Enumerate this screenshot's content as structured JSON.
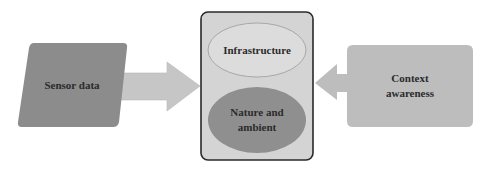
{
  "diagram": {
    "nodes": [
      {
        "id": "sensor",
        "label": "Sensor data",
        "shape": "parallelogram",
        "fill": "#8c8c8c"
      },
      {
        "id": "center",
        "label": "",
        "shape": "rounded-rect",
        "fill": "#d4d4d4",
        "stroke": "#2a2a2a"
      },
      {
        "id": "infra",
        "label": "Infrastructure",
        "shape": "ellipse",
        "fill": "#dcdcdc",
        "stroke": "#9a9a9a"
      },
      {
        "id": "nature",
        "label_line1": "Nature and",
        "label_line2": "ambient",
        "shape": "ellipse",
        "fill": "#8f8f8f"
      },
      {
        "id": "context",
        "label_line1": "Context",
        "label_line2": "awareness",
        "shape": "left-arrow-callout",
        "fill": "#bdbdbd"
      }
    ],
    "edges": [
      {
        "from": "sensor",
        "to": "center",
        "type": "block-arrow",
        "fill": "#c6c6c6"
      },
      {
        "from": "context",
        "to": "center",
        "type": "callout-arrow",
        "fill": "#bdbdbd"
      }
    ]
  }
}
